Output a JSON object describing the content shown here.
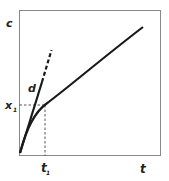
{
  "diagram": {
    "y_axis_label": "c",
    "x_axis_label": "t",
    "x_marker_label": "t",
    "x_marker_subscript": "1",
    "y_marker_label": "x",
    "y_marker_subscript": "1",
    "tangent_label": "d",
    "curve_description": "concave increasing curve from origin",
    "tangent_description": "initial slope tangent line, solid then dashed",
    "colors": {
      "line": "#1a1a1a",
      "frame": "#777777",
      "guide": "#444444"
    }
  }
}
